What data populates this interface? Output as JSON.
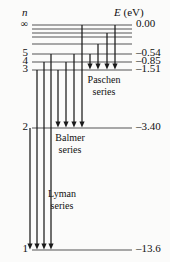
{
  "figure": {
    "type": "energy-level-diagram",
    "headers": {
      "left": "n",
      "right_symbol": "E",
      "right_unit": "(eV)"
    },
    "levels": [
      {
        "n": "∞",
        "energy": "0.00",
        "y": 25,
        "x_start": 32,
        "x_end": 132
      },
      {
        "n": "",
        "energy": "",
        "y": 29,
        "x_start": 32,
        "x_end": 132
      },
      {
        "n": "",
        "energy": "",
        "y": 33,
        "x_start": 32,
        "x_end": 132
      },
      {
        "n": "",
        "energy": "",
        "y": 37,
        "x_start": 32,
        "x_end": 132
      },
      {
        "n": "",
        "energy": "",
        "y": 44,
        "x_start": 32,
        "x_end": 132
      },
      {
        "n": "5",
        "energy": "–0.54",
        "y": 54,
        "x_start": 32,
        "x_end": 132
      },
      {
        "n": "4",
        "energy": "–0.85",
        "y": 62,
        "x_start": 32,
        "x_end": 132
      },
      {
        "n": "3",
        "energy": "–1.51",
        "y": 70,
        "x_start": 32,
        "x_end": 132
      },
      {
        "n": "2",
        "energy": "–3.40",
        "y": 128,
        "x_start": 32,
        "x_end": 132
      },
      {
        "n": "1",
        "energy": "–13.6",
        "y": 250,
        "x_start": 32,
        "x_end": 132
      }
    ],
    "series": [
      {
        "name": "Paschen\nseries",
        "line1": "Paschen",
        "line2": "series",
        "label_x": 104,
        "label_y": 74,
        "target_y": 70,
        "arrows": [
          {
            "x": 90,
            "from_y": 54
          },
          {
            "x": 98,
            "from_y": 44
          },
          {
            "x": 107,
            "from_y": 33
          },
          {
            "x": 115,
            "from_y": 25
          }
        ]
      },
      {
        "name": "Balmer\nseries",
        "line1": "Balmer",
        "line2": "series",
        "label_x": 70,
        "label_y": 132,
        "target_y": 128,
        "arrows": [
          {
            "x": 58,
            "from_y": 70
          },
          {
            "x": 66,
            "from_y": 62
          },
          {
            "x": 74,
            "from_y": 54
          },
          {
            "x": 82,
            "from_y": 25
          }
        ]
      },
      {
        "name": "Lyman\nseries",
        "line1": "Lyman",
        "line2": "series",
        "label_x": 62,
        "label_y": 188,
        "target_y": 250,
        "arrows": [
          {
            "x": 30,
            "from_y": 128
          },
          {
            "x": 37,
            "from_y": 70
          },
          {
            "x": 44,
            "from_y": 62
          },
          {
            "x": 51,
            "from_y": 54
          }
        ]
      }
    ],
    "colors": {
      "ink": "#1a1a1a",
      "level_line": "#555555",
      "background": "#fbfbfa"
    }
  }
}
